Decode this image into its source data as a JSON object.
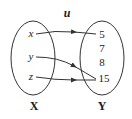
{
  "title": "u",
  "domain_set": {
    "label": "X",
    "elements": [
      "x",
      "y",
      "z"
    ]
  },
  "codomain_set": {
    "label": "Y",
    "elements": [
      "5",
      "7",
      "8",
      "15"
    ]
  },
  "mappings": [
    {
      "from": "x",
      "to": "5"
    },
    {
      "from": "y",
      "to": "15"
    },
    {
      "from": "z",
      "to": "15"
    }
  ],
  "colors": {
    "stroke": "#333333",
    "text": "#1a1a1a",
    "background": "#ffffff"
  }
}
